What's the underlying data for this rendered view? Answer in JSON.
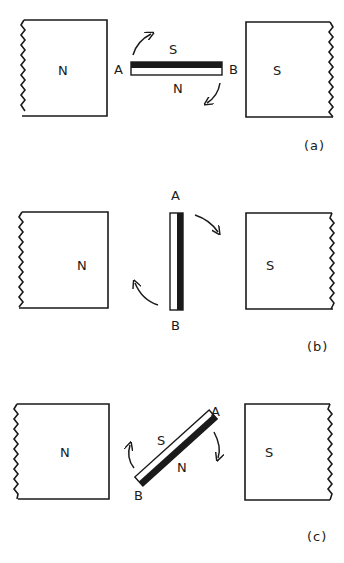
{
  "panels": [
    {
      "caption": "(a)",
      "left_pole": "N",
      "right_pole": "S",
      "bar": {
        "end_a": "A",
        "end_b": "B",
        "face_top": "S",
        "face_bottom": "N",
        "orientation": "horizontal"
      }
    },
    {
      "caption": "(b)",
      "left_pole": "N",
      "right_pole": "S",
      "bar": {
        "end_a": "A",
        "end_b": "B",
        "orientation": "vertical"
      }
    },
    {
      "caption": "(c)",
      "left_pole": "N",
      "right_pole": "S",
      "bar": {
        "end_a": "A",
        "end_b": "B",
        "face_top": "S",
        "face_bottom": "N",
        "orientation": "diagonal"
      }
    }
  ],
  "colors": {
    "ink": "#1a1a1a",
    "background": "#ffffff"
  }
}
